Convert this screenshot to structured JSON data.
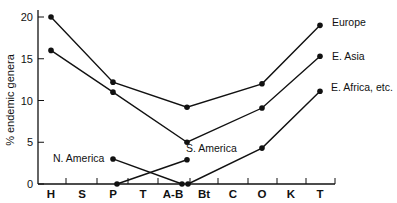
{
  "chart_data": {
    "type": "line",
    "title": "",
    "xlabel": "",
    "ylabel": "% endemic genera",
    "ylim": [
      0,
      20
    ],
    "yticks": [
      0,
      5,
      10,
      15,
      20
    ],
    "categories": [
      "H",
      "S",
      "P",
      "T",
      "A-B",
      "Bt",
      "C",
      "O",
      "K",
      "T"
    ],
    "grid": false,
    "series": [
      {
        "name": "Europe",
        "x": [
          "H",
          "P",
          "A-B",
          "O",
          "T"
        ],
        "values": [
          20,
          12.2,
          9.2,
          12,
          19
        ]
      },
      {
        "name": "E. Asia",
        "x": [
          "H",
          "P",
          "A-B",
          "O",
          "T"
        ],
        "values": [
          16,
          11,
          5,
          9.1,
          15.3
        ]
      },
      {
        "name": "E. Africa, etc.",
        "x": [
          "A-B",
          "O",
          "T"
        ],
        "values": [
          0,
          4.3,
          11.1
        ]
      },
      {
        "name": "S. America",
        "x": [
          "P",
          "A-B"
        ],
        "values": [
          0,
          2.9
        ]
      },
      {
        "name": "N. America",
        "x": [
          "P",
          "A-B"
        ],
        "values": [
          3,
          0
        ]
      }
    ],
    "labels": {
      "europe": "Europe",
      "e_asia": "E. Asia",
      "e_africa": "E. Africa, etc.",
      "s_america": "S. America",
      "n_america": "N. America"
    }
  }
}
